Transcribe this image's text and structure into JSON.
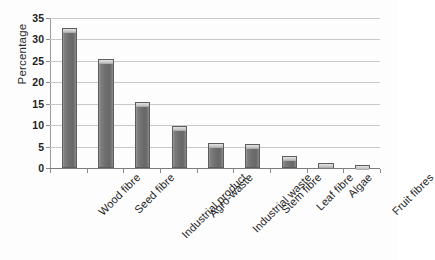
{
  "chart_data": {
    "type": "bar",
    "title": "",
    "xlabel": "",
    "ylabel": "Percentage",
    "categories": [
      "Wood fibre",
      "Seed fibre",
      "Industrial product",
      "Agro-waste",
      "Industrial waste",
      "Stem fibre",
      "Leaf fibre",
      "Algae",
      "Fruit fibres"
    ],
    "values": [
      32.6,
      25.4,
      15.5,
      9.9,
      5.9,
      5.5,
      2.7,
      1.1,
      0.7
    ],
    "ylim": [
      0,
      35
    ],
    "ytick_labels": [
      "0",
      "5",
      "10",
      "15",
      "20",
      "25",
      "30",
      "35"
    ],
    "ytick_values": [
      0,
      5,
      10,
      15,
      20,
      25,
      30,
      35
    ],
    "grid": "horizontal",
    "legend": "none",
    "bar_color": "#6e6e6e",
    "bar_edge_color": "#5d5d5d",
    "bar_cap_color": "#d9d9d9",
    "gridline_color": "#c9c9c9",
    "axis_color": "#8c8c8c",
    "background_color": "#fdfdfd",
    "text_color": "#232323",
    "xtick_rotation": 45
  }
}
